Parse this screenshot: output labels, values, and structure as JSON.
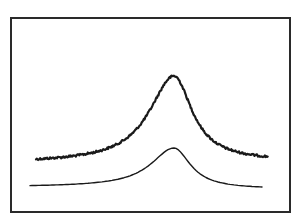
{
  "chart_data": {
    "type": "line",
    "title": "",
    "xlabel": "",
    "ylabel": "",
    "grid": false,
    "legend": null,
    "frame": {
      "x": 11,
      "y": 18,
      "width": 279,
      "height": 194,
      "color": "#2a2a2a"
    },
    "series": [
      {
        "name": "measured spectrum (noisy)",
        "style": "noisy",
        "color": "#1a1a1a",
        "stroke_width": 2.2,
        "peak": {
          "x": 174,
          "y": 76
        },
        "baseline_y_left": 163,
        "baseline_y_right": 161,
        "x_start": 36,
        "x_end": 268,
        "halfwidth_left": 30,
        "halfwidth_right": 22
      },
      {
        "name": "fit / theory (smooth)",
        "style": "smooth",
        "color": "#1a1a1a",
        "stroke_width": 1.4,
        "peak": {
          "x": 174,
          "y": 148
        },
        "baseline_y_left": 187,
        "baseline_y_right": 189,
        "x_start": 30,
        "x_end": 262,
        "halfwidth_left": 28,
        "halfwidth_right": 20
      }
    ]
  }
}
